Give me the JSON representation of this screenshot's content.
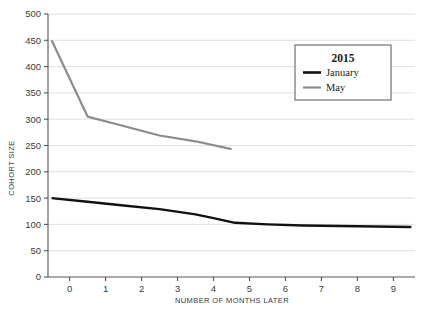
{
  "chart_data": {
    "type": "line",
    "title": "",
    "xlabel": "NUMBER OF MONTHS LATER",
    "ylabel": "COHORT SIZE",
    "xlim": [
      -0.6,
      9.6
    ],
    "ylim": [
      0,
      500
    ],
    "grid": "horizontal",
    "legend_position": "top-right",
    "legend_title": "2015",
    "x_ticks": [
      "0",
      "1",
      "2",
      "3",
      "4",
      "5",
      "6",
      "7",
      "8",
      "9"
    ],
    "x_tick_values": [
      0,
      1,
      2,
      3,
      4,
      5,
      6,
      7,
      8,
      9
    ],
    "y_ticks": [
      "0",
      "50",
      "100",
      "150",
      "200",
      "250",
      "300",
      "350",
      "400",
      "450",
      "500"
    ],
    "y_tick_values": [
      0,
      50,
      100,
      150,
      200,
      250,
      300,
      350,
      400,
      450,
      500
    ],
    "series": [
      {
        "name": "January",
        "color": "#111111",
        "x": [
          -0.5,
          0.5,
          1.5,
          2.5,
          3.5,
          4.0,
          4.6,
          5.5,
          6.5,
          7.5,
          8.5,
          9.5
        ],
        "values": [
          150,
          143,
          136,
          129,
          119,
          112,
          103,
          100,
          98,
          97,
          96,
          95
        ]
      },
      {
        "name": "May",
        "color": "#8c8c8c",
        "x": [
          -0.5,
          0.5,
          1.5,
          2.5,
          3.5,
          4.5
        ],
        "values": [
          450,
          305,
          287,
          269,
          258,
          243
        ]
      }
    ]
  },
  "legend": {
    "title": "2015",
    "entries": [
      {
        "label": "January",
        "color": "#111111"
      },
      {
        "label": "May",
        "color": "#8c8c8c"
      }
    ]
  },
  "axes": {
    "x_title": "NUMBER OF MONTHS LATER",
    "y_title": "COHORT SIZE"
  }
}
